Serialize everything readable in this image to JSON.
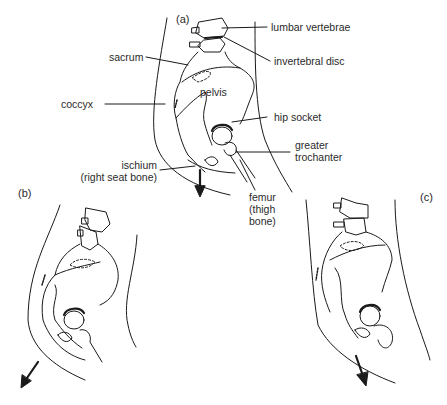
{
  "figure": {
    "panels": [
      {
        "id": "a",
        "label": "(a)",
        "arrow_direction": "down"
      },
      {
        "id": "b",
        "label": "(b)",
        "arrow_direction": "down-left"
      },
      {
        "id": "c",
        "label": "(c)",
        "arrow_direction": "down-right"
      }
    ],
    "labels": {
      "lumbar_vertebrae": "lumbar vertebrae",
      "invertebral_disc": "invertebral disc",
      "sacrum": "sacrum",
      "pelvis": "pelvis",
      "coccyx": "coccyx",
      "hip_socket": "hip socket",
      "greater_trochanter_1": "greater",
      "greater_trochanter_2": "trochanter",
      "ischium_1": "ischium",
      "ischium_2": "(right seat bone)",
      "femur_1": "femur",
      "femur_2": "(thigh",
      "femur_3": "bone)"
    },
    "colors": {
      "line": "#1a1a1a",
      "background": "#ffffff"
    }
  }
}
